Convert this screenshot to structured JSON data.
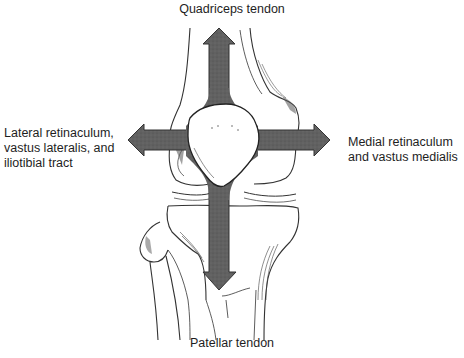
{
  "diagram": {
    "labels": {
      "top": "Quadriceps tendon",
      "left_line1": "Lateral retinaculum,",
      "left_line2": "vastus lateralis, and",
      "left_line3": "iliotibial tract",
      "right_line1": "Medial retinaculum",
      "right_line2": "and vastus medialis",
      "bottom": "Patellar tendon"
    },
    "arrows": [
      {
        "direction": "up",
        "target": "Quadriceps tendon"
      },
      {
        "direction": "left",
        "target": "Lateral retinaculum, vastus lateralis, and iliotibial tract"
      },
      {
        "direction": "right",
        "target": "Medial retinaculum and vastus medialis"
      },
      {
        "direction": "down",
        "target": "Patellar tendon"
      }
    ],
    "colors": {
      "arrow_fill": "#5f5f5f",
      "line": "#333333",
      "background": "#ffffff"
    }
  }
}
